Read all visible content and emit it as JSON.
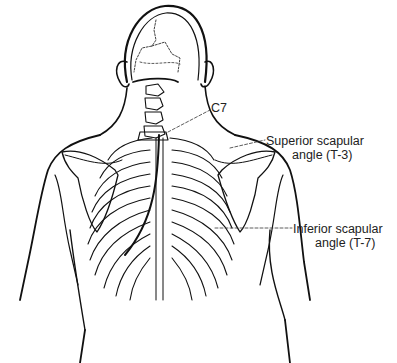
{
  "diagram": {
    "labels": [
      {
        "id": "c7",
        "text": "C7"
      },
      {
        "id": "superior",
        "line1": "Superior scapular",
        "line2": "angle (T-3)"
      },
      {
        "id": "inferior",
        "line1": "Inferior scapular",
        "line2": "angle (T-7)"
      }
    ],
    "colors": {
      "ink": "#111111",
      "background": "#ffffff",
      "label": "#222222"
    }
  }
}
